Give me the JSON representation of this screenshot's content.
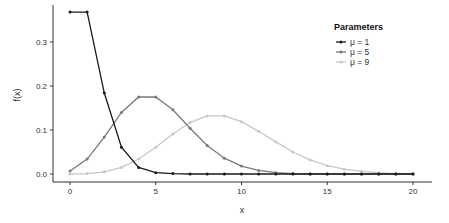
{
  "chart_data": {
    "type": "line",
    "title": "",
    "xlabel": "x",
    "ylabel": "f(x)",
    "xlim": [
      0,
      20
    ],
    "ylim": [
      0,
      0.37
    ],
    "x_ticks": [
      0,
      5,
      10,
      15,
      20
    ],
    "y_ticks": [
      0.0,
      0.1,
      0.2,
      0.3
    ],
    "y_tick_labels": [
      "0.0",
      "0.1",
      "0.2",
      "0.3"
    ],
    "grid": false,
    "legend_position": "top-right",
    "legend_title": "Parameters",
    "x": [
      0,
      1,
      2,
      3,
      4,
      5,
      6,
      7,
      8,
      9,
      10,
      11,
      12,
      13,
      14,
      15,
      16,
      17,
      18,
      19,
      20
    ],
    "series": [
      {
        "name": "μ = 1",
        "color": "#1a1a1a",
        "values": [
          0.368,
          0.368,
          0.184,
          0.061,
          0.015,
          0.003,
          0.001,
          0,
          0,
          0,
          0,
          0,
          0,
          0,
          0,
          0,
          0,
          0,
          0,
          0,
          0
        ]
      },
      {
        "name": "μ = 5",
        "color": "#7a7a7a",
        "values": [
          0.007,
          0.034,
          0.084,
          0.14,
          0.175,
          0.175,
          0.146,
          0.104,
          0.065,
          0.036,
          0.018,
          0.008,
          0.003,
          0.001,
          0,
          0,
          0,
          0,
          0,
          0,
          0
        ]
      },
      {
        "name": "μ = 9",
        "color": "#c8c8c8",
        "values": [
          0.0,
          0.001,
          0.005,
          0.015,
          0.034,
          0.061,
          0.091,
          0.117,
          0.132,
          0.132,
          0.119,
          0.097,
          0.073,
          0.05,
          0.032,
          0.019,
          0.011,
          0.006,
          0.003,
          0.001,
          0.001
        ]
      }
    ]
  }
}
